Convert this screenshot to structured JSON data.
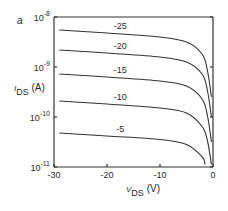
{
  "panel_label": "a",
  "chart_data": {
    "type": "line",
    "title": "",
    "xlabel": "V_DS (V)",
    "ylabel": "I_DS (A)",
    "xlim": [
      -30,
      0
    ],
    "ylim_log10": [
      -11,
      -8
    ],
    "yscale": "log",
    "x_ticks": [
      -30,
      -20,
      -10,
      0
    ],
    "x_tick_labels": [
      "-30",
      "-20",
      "-10",
      "0"
    ],
    "y_ticks_log10": [
      -8,
      -9,
      -10,
      -11
    ],
    "y_tick_labels": [
      {
        "base": "10",
        "exp": "-8"
      },
      {
        "base": "10",
        "exp": "-9"
      },
      {
        "base": "10",
        "exp": "-10"
      },
      {
        "base": "10",
        "exp": "-11"
      }
    ],
    "grid": false,
    "legend": "inline curve labels",
    "series": [
      {
        "name": "-25",
        "x": [
          -29,
          -20,
          -10,
          -5,
          -2,
          -1,
          -0.3
        ],
        "log10_y": [
          -8.26,
          -8.32,
          -8.4,
          -8.5,
          -8.75,
          -9.1,
          -9.6
        ]
      },
      {
        "name": "-20",
        "x": [
          -29,
          -20,
          -10,
          -5,
          -2,
          -1,
          -0.3
        ],
        "log10_y": [
          -8.66,
          -8.72,
          -8.8,
          -8.9,
          -9.15,
          -9.5,
          -10.0
        ]
      },
      {
        "name": "-15",
        "x": [
          -29,
          -20,
          -10,
          -5,
          -2,
          -1,
          -0.3
        ],
        "log10_y": [
          -9.14,
          -9.2,
          -9.28,
          -9.38,
          -9.65,
          -10.0,
          -10.5
        ]
      },
      {
        "name": "-10",
        "x": [
          -29,
          -20,
          -10,
          -5,
          -2,
          -1,
          -0.3
        ],
        "log10_y": [
          -9.68,
          -9.74,
          -9.82,
          -9.92,
          -10.2,
          -10.5,
          -10.95
        ]
      },
      {
        "name": "-5",
        "x": [
          -29,
          -20,
          -10,
          -5,
          -2,
          -1.5
        ],
        "log10_y": [
          -10.32,
          -10.38,
          -10.45,
          -10.55,
          -10.8,
          -10.95
        ]
      }
    ],
    "curve_labels": [
      "-25",
      "-20",
      "-15",
      "-10",
      "-5"
    ]
  },
  "axis_labels": {
    "y_main": "I",
    "y_sub": "DS",
    "y_unit": "(A)",
    "x_main": "V",
    "x_sub": "DS",
    "x_unit": "(V)"
  }
}
